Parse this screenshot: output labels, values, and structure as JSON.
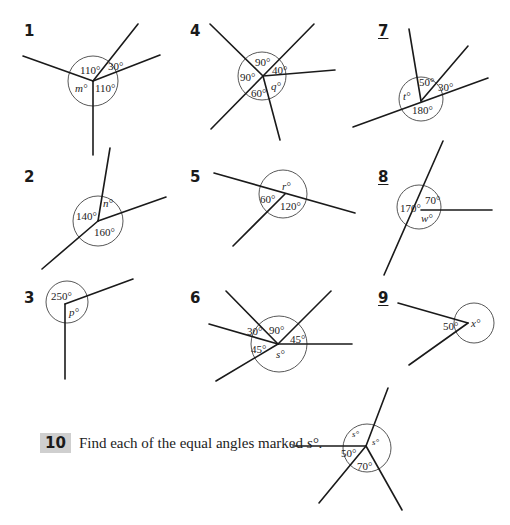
{
  "header_partial": "Hobbies.",
  "questions": [
    {
      "number": "1",
      "underlined": false,
      "angles": [
        "110°",
        "30°",
        "110°",
        "m°"
      ],
      "unknown": "m"
    },
    {
      "number": "2",
      "underlined": false,
      "angles": [
        "n°",
        "140°",
        "160°"
      ],
      "unknown": "n"
    },
    {
      "number": "3",
      "underlined": false,
      "angles": [
        "250°",
        "p°"
      ],
      "unknown": "p"
    },
    {
      "number": "4",
      "underlined": false,
      "angles": [
        "90°",
        "40°",
        "90°",
        "60°",
        "q°"
      ],
      "unknown": "q"
    },
    {
      "number": "5",
      "underlined": false,
      "angles": [
        "r°",
        "60°",
        "120°"
      ],
      "unknown": "r"
    },
    {
      "number": "6",
      "underlined": false,
      "angles": [
        "30°",
        "90°",
        "45°",
        "45°",
        "s°"
      ],
      "unknown": "s"
    },
    {
      "number": "7",
      "underlined": true,
      "angles": [
        "50°",
        "30°",
        "t°",
        "180°"
      ],
      "unknown": "t"
    },
    {
      "number": "8",
      "underlined": true,
      "angles": [
        "170°",
        "70°",
        "w°"
      ],
      "unknown": "w"
    },
    {
      "number": "9",
      "underlined": true,
      "angles": [
        "50°",
        "x°"
      ],
      "unknown": "x"
    }
  ],
  "question10": {
    "number": "10",
    "text": "Find each of the equal angles marked ",
    "var": "s°",
    "end": ".",
    "angles": [
      "s°",
      "s°",
      "50°",
      "70°"
    ]
  }
}
